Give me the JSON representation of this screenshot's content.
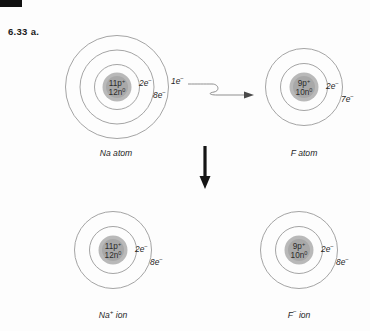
{
  "problem": {
    "label": "6.33  a."
  },
  "diagram": {
    "type": "bohr-model-electron-transfer",
    "arrows": {
      "electron_transfer": "wavy-right-arrow",
      "reaction": "down-arrow"
    }
  },
  "atoms": [
    {
      "id": "na-atom",
      "caption": "Na atom",
      "caption_sup": "",
      "protons": "11p",
      "protons_sup": "+",
      "neutrons": "12n",
      "neutrons_sup": "0",
      "shells": [
        {
          "label": "2e",
          "sup": "−"
        },
        {
          "label": "8e",
          "sup": "−"
        },
        {
          "label": "1e",
          "sup": "−"
        }
      ]
    },
    {
      "id": "f-atom",
      "caption": "F atom",
      "caption_sup": "",
      "protons": "9p",
      "protons_sup": "+",
      "neutrons": "10n",
      "neutrons_sup": "0",
      "shells": [
        {
          "label": "2e",
          "sup": "−"
        },
        {
          "label": "7e",
          "sup": "−"
        }
      ]
    },
    {
      "id": "na-ion",
      "caption": "Na",
      "caption_sup": "+",
      "caption_tail": " ion",
      "protons": "11p",
      "protons_sup": "+",
      "neutrons": "12n",
      "neutrons_sup": "0",
      "shells": [
        {
          "label": "2e",
          "sup": "−"
        },
        {
          "label": "8e",
          "sup": "−"
        }
      ]
    },
    {
      "id": "f-ion",
      "caption": "F",
      "caption_sup": "−",
      "caption_tail": " ion",
      "protons": "9p",
      "protons_sup": "+",
      "neutrons": "10n",
      "neutrons_sup": "0",
      "shells": [
        {
          "label": "2e",
          "sup": "−"
        },
        {
          "label": "8e",
          "sup": "−"
        }
      ]
    }
  ],
  "colors": {
    "background": "#fdfdfd",
    "ring_stroke": "#9a9a9a",
    "nucleus_fill": "#b9b9b9",
    "text": "#1f1f1f",
    "arrow_dark": "#151515"
  }
}
